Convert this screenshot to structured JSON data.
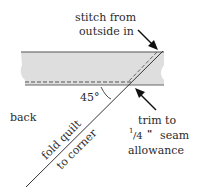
{
  "diagram": {
    "labels": {
      "stitch_line1": "stitch from",
      "stitch_line2": "outside in",
      "angle": "45°",
      "back": "back",
      "fold_line1": "fold quilt",
      "fold_line2": "to corner",
      "trim_line1": "trim to",
      "trim_frac_num": "1",
      "trim_frac_den": "/4",
      "trim_frac_inch": "\"",
      "trim_seam": "seam",
      "trim_line3": "allowance"
    },
    "colors": {
      "strip_fill": "#dedede",
      "line": "#333333",
      "text": "#2a2a2a"
    }
  }
}
